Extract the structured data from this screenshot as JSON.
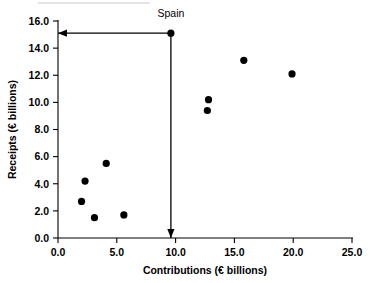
{
  "chart_data": {
    "type": "scatter",
    "title": "",
    "xlabel": "Contributions (€ billions)",
    "ylabel": "Receipts (€ billions)",
    "xlim": [
      0.0,
      25.0
    ],
    "ylim": [
      0.0,
      16.0
    ],
    "xticks": [
      "0.0",
      "5.0",
      "10.0",
      "15.0",
      "20.0",
      "25.0"
    ],
    "yticks": [
      "0.0",
      "2.0",
      "4.0",
      "6.0",
      "8.0",
      "10.0",
      "12.0",
      "14.0",
      "16.0"
    ],
    "xtick_values": [
      0.0,
      5.0,
      10.0,
      15.0,
      20.0,
      25.0
    ],
    "ytick_values": [
      0.0,
      2.0,
      4.0,
      6.0,
      8.0,
      10.0,
      12.0,
      14.0,
      16.0
    ],
    "grid": false,
    "legend": false,
    "points": [
      {
        "x": 2.0,
        "y": 2.7,
        "label": ""
      },
      {
        "x": 2.3,
        "y": 4.2,
        "label": ""
      },
      {
        "x": 3.1,
        "y": 1.5,
        "label": ""
      },
      {
        "x": 4.1,
        "y": 5.5,
        "label": ""
      },
      {
        "x": 5.6,
        "y": 1.7,
        "label": ""
      },
      {
        "x": 9.6,
        "y": 15.1,
        "label": "Spain"
      },
      {
        "x": 12.7,
        "y": 9.4,
        "label": ""
      },
      {
        "x": 12.8,
        "y": 10.2,
        "label": ""
      },
      {
        "x": 15.8,
        "y": 13.1,
        "label": ""
      },
      {
        "x": 19.9,
        "y": 12.1,
        "label": ""
      }
    ],
    "annotations": [
      {
        "name": "spain-label",
        "text": "Spain",
        "x": 9.6,
        "y": 16.5
      },
      {
        "name": "spain-receipts-arrow",
        "text": "",
        "from": {
          "x": 9.6,
          "y": 15.1
        },
        "to": {
          "x": 0.0,
          "y": 15.1
        }
      },
      {
        "name": "spain-contributions-arrow",
        "text": "",
        "from": {
          "x": 9.6,
          "y": 15.1
        },
        "to": {
          "x": 9.6,
          "y": 0.0
        }
      }
    ]
  },
  "axes": {
    "x_title": "Contributions (€ billions)",
    "y_title": "Receipts (€ billions)"
  },
  "colors": {
    "point": "#000000",
    "axis": "#000000",
    "background": "#ffffff"
  }
}
